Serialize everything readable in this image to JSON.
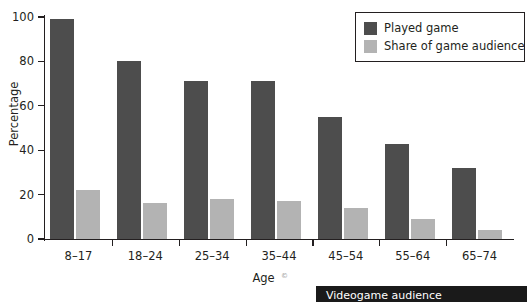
{
  "chart_data": {
    "type": "bar",
    "title": "",
    "xlabel": "Age",
    "ylabel": "Percentage",
    "categories": [
      "8–17",
      "18–24",
      "25–34",
      "35–44",
      "45–54",
      "55–64",
      "65–74"
    ],
    "series": [
      {
        "name": "Played game",
        "color": "#4d4d4d",
        "values": [
          99,
          80,
          71,
          71,
          55,
          43,
          32
        ]
      },
      {
        "name": "Share of game audience",
        "color": "#b3b3b3",
        "values": [
          22,
          16,
          18,
          17,
          14,
          9,
          4
        ]
      }
    ],
    "ylim": [
      0,
      100
    ],
    "yticks": [
      0,
      20,
      40,
      60,
      80,
      100
    ],
    "ytick_labels": [
      "0",
      "20",
      "40",
      "60",
      "80",
      "100"
    ],
    "grid": false,
    "legend_position": "top-right"
  },
  "legend": {
    "entries": [
      {
        "label": "Played game"
      },
      {
        "label": "Share of game audience"
      }
    ]
  },
  "banner": {
    "text": "Videogame audience",
    "corner_mark": "©"
  }
}
